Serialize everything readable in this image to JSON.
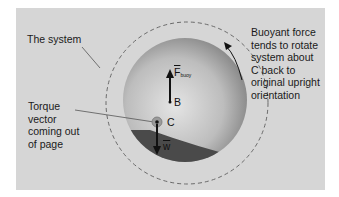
{
  "diagram": {
    "labels": {
      "system": "The system",
      "buoyant_note": "Buoyant force\ntends to rotate\nsystem about\nC back to\noriginal upright\norientation",
      "torque_note": "Torque\nvector\ncoming out\nof page"
    },
    "points": {
      "B": "B",
      "C": "C"
    },
    "vectors": {
      "buoyant_force": "F",
      "buoyant_subscript": "buoy",
      "weight": "w"
    },
    "colors": {
      "background": "#d6d6d6",
      "sphere_light": "#e2e2e2",
      "sphere_dark": "#8a8a8a",
      "liquid": "#4a4a4a",
      "dashed_circle": "#6a6a6a",
      "arrow": "#111111"
    }
  }
}
